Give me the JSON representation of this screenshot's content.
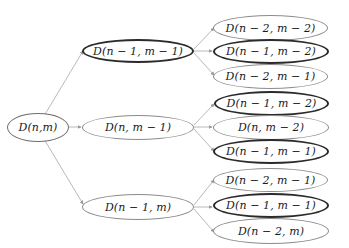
{
  "diagram": {
    "title": "",
    "type": "recursion-tree",
    "colors": {
      "edge": "#b8b8b8",
      "node_border_light": "#8c8c8c",
      "node_border_dark": "#2b2b2b",
      "text": "#1a1a1a"
    },
    "nodes": {
      "root": {
        "label": "D(n,m)",
        "style": "mid"
      },
      "level1": [
        {
          "label": "D(n − 1, m − 1)",
          "style": "dark"
        },
        {
          "label": "D(n, m − 1)",
          "style": "light"
        },
        {
          "label": "D(n − 1, m)",
          "style": "light"
        }
      ],
      "level2": [
        {
          "label": "D(n − 2, m − 2)",
          "style": "light",
          "parent": 0
        },
        {
          "label": "D(n − 1, m − 2)",
          "style": "dark",
          "parent": 0
        },
        {
          "label": "D(n − 2, m − 1)",
          "style": "light",
          "parent": 0
        },
        {
          "label": "D(n − 1, m − 2)",
          "style": "dark",
          "parent": 1
        },
        {
          "label": "D(n, m − 2)",
          "style": "light",
          "parent": 1
        },
        {
          "label": "D(n − 1, m − 1)",
          "style": "dark",
          "parent": 1
        },
        {
          "label": "D(n − 2, m − 1)",
          "style": "light",
          "parent": 2
        },
        {
          "label": "D(n − 1, m − 1)",
          "style": "dark",
          "parent": 2
        },
        {
          "label": "D(n − 2, m)",
          "style": "light",
          "parent": 2
        }
      ]
    }
  }
}
